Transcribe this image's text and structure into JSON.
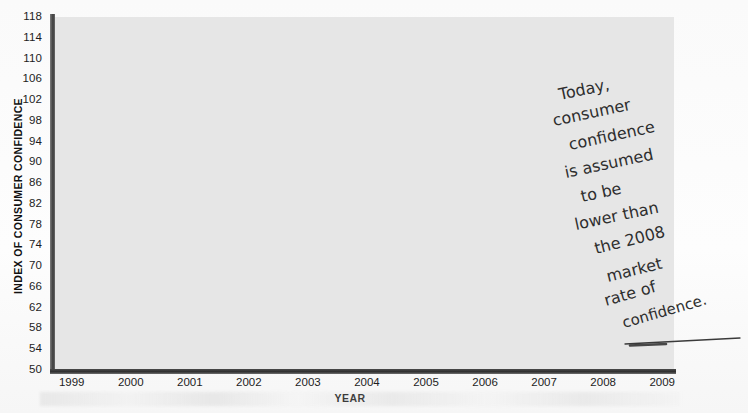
{
  "chart_data": {
    "type": "line",
    "title": "",
    "xlabel": "YEAR",
    "ylabel": "INDEX OF CONSUMER CONFIDENCE",
    "ylim": [
      50,
      118
    ],
    "xlim": [
      1998.7,
      2009.2
    ],
    "grid": true,
    "legend": null,
    "yticks": [
      50,
      54,
      58,
      62,
      66,
      70,
      74,
      78,
      82,
      86,
      90,
      94,
      98,
      102,
      106,
      110,
      114,
      118
    ],
    "xticks": [
      1999,
      2000,
      2001,
      2002,
      2003,
      2004,
      2005,
      2006,
      2007,
      2008,
      2009
    ],
    "series": [
      {
        "name": "Index of Consumer Confidence",
        "x": [
          1998.75,
          1998.95,
          1999.15,
          1999.35,
          1999.6,
          1999.8,
          2000.0,
          2000.2,
          2000.4,
          2000.6,
          2000.75,
          2000.95,
          2001.1,
          2001.3,
          2001.5,
          2001.7,
          2001.9,
          2002.1,
          2002.3,
          2002.5,
          2002.7,
          2002.9,
          2003.1,
          2003.3,
          2003.5,
          2003.7,
          2003.9,
          2004.1,
          2004.3,
          2004.5,
          2004.7,
          2004.9,
          2005.1,
          2005.3,
          2005.5,
          2005.7,
          2005.9,
          2006.1,
          2006.3,
          2006.5,
          2006.7,
          2006.9,
          2007.1,
          2007.3,
          2007.5,
          2007.7,
          2007.9,
          2008.1,
          2008.3,
          2008.5,
          2008.7,
          2008.85
        ],
        "values": [
          102.5,
          108.0,
          106.5,
          104.5,
          107.5,
          111.5,
          110.5,
          107.0,
          108.0,
          107.8,
          90.5,
          92.0,
          91.5,
          84.0,
          97.0,
          93.0,
          87.5,
          83.0,
          80.5,
          89.5,
          89.5,
          91.0,
          94.0,
          98.0,
          94.0,
          95.5,
          93.5,
          94.0,
          93.0,
          91.5,
          88.0,
          86.5,
          85.5,
          84.0,
          89.0,
          83.5,
          80.0,
          91.5,
          92.0,
          90.0,
          87.0,
          82.0,
          77.0,
          74.0,
          68.0,
          62.5,
          60.0,
          63.0,
          58.5,
          55.0,
          57.0,
          58.5
        ]
      }
    ],
    "colors": {
      "line": "#8d8d8d",
      "fill_below": "#c6c6c6",
      "fill_above": "#e6e6e6",
      "gridline": "#ffffff",
      "axis": "#333333",
      "text": "#1d1d1d"
    }
  },
  "annotation": {
    "lines": [
      "Today,",
      "consumer",
      "confidence",
      "is assumed",
      "to be",
      "lower than",
      "the 2008",
      "market",
      "rate of",
      "confidence."
    ],
    "full_text": "Today, consumer confidence is assumed to be lower than the 2008 market rate of confidence.",
    "pointer": "leader-line-to-2008-low"
  }
}
